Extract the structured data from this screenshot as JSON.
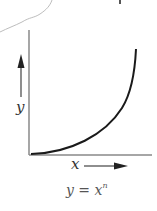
{
  "diagram": {
    "caption": {
      "base": "y = x",
      "exponent": "n"
    },
    "axes": {
      "x_label": "x",
      "y_label": "y",
      "x_arrow": "arrow-right",
      "y_arrow": "arrow-up"
    },
    "curve": {
      "equation": "y = x^n",
      "shape": "convex increasing"
    },
    "colors": {
      "axis": "#777777",
      "curve": "#1a1a1a",
      "arrow": "#333333",
      "page_edge": "#bbbbbb",
      "text": "#333333"
    }
  }
}
